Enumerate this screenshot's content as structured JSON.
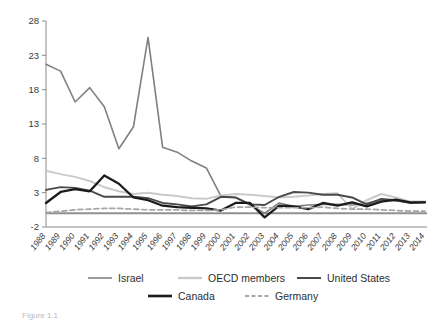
{
  "chart_data": {
    "type": "line",
    "title": "",
    "subtitle": "",
    "xlabel": "",
    "ylabel": "",
    "grid": false,
    "legend_position": "bottom",
    "xlim": [
      1988,
      2014
    ],
    "ylim": [
      -2,
      28
    ],
    "ytick_values": [
      28,
      23,
      18,
      13,
      8,
      3,
      -2
    ],
    "ytick_labels": [
      "28",
      "23",
      "18",
      "13",
      "8",
      "3",
      "-2"
    ],
    "categories": [
      "1988",
      "1989",
      "1990",
      "1991",
      "1992",
      "1993",
      "1994",
      "1995",
      "1996",
      "1997",
      "1998",
      "1999",
      "2000",
      "2001",
      "2002",
      "2003",
      "2004",
      "2005",
      "2006",
      "2007",
      "2008",
      "2009",
      "2010",
      "2011",
      "2012",
      "2013",
      "2014"
    ],
    "zero_line": 0,
    "series": [
      {
        "name": "Israel",
        "color": "#808080",
        "width": 1.6,
        "dash": "none",
        "values": [
          21.7,
          20.7,
          16.2,
          18.3,
          15.5,
          9.4,
          12.6,
          25.6,
          9.6,
          8.9,
          7.6,
          6.6,
          2.5,
          2.3,
          1.2,
          0.0,
          1.5,
          1.0,
          1.2,
          1.3,
          1.3,
          1.2,
          1.5,
          1.9,
          1.8,
          1.6,
          1.6
        ]
      },
      {
        "name": "OECD members",
        "color": "#cacaca",
        "width": 2.0,
        "dash": "none",
        "values": [
          6.2,
          5.7,
          5.3,
          4.7,
          3.8,
          3.2,
          2.8,
          3.0,
          2.7,
          2.5,
          2.2,
          2.1,
          2.6,
          2.8,
          2.7,
          2.5,
          2.3,
          2.4,
          2.6,
          2.8,
          2.9,
          0.6,
          1.9,
          2.8,
          2.3,
          1.7,
          1.7
        ]
      },
      {
        "name": "United States",
        "color": "#4a4a4a",
        "width": 1.9,
        "dash": "none",
        "values": [
          3.4,
          3.8,
          3.7,
          3.3,
          2.4,
          2.4,
          2.4,
          2.2,
          1.5,
          1.3,
          1.0,
          1.3,
          2.4,
          2.3,
          1.3,
          1.2,
          2.4,
          3.1,
          3.0,
          2.7,
          2.7,
          2.3,
          1.3,
          2.1,
          1.9,
          1.5,
          1.6
        ]
      },
      {
        "name": "Canada",
        "color": "#1b1b1b",
        "width": 2.3,
        "dash": "none",
        "values": [
          1.5,
          3.1,
          3.5,
          3.2,
          5.5,
          4.3,
          2.3,
          1.9,
          1.1,
          0.9,
          0.8,
          0.7,
          0.4,
          1.5,
          1.5,
          -0.6,
          1.1,
          1.0,
          0.6,
          1.5,
          1.1,
          1.6,
          1.0,
          1.7,
          2.0,
          1.6,
          1.6
        ]
      },
      {
        "name": "Germany",
        "color": "#a5a5a5",
        "width": 1.7,
        "dash": "5,3",
        "values": [
          0.1,
          0.3,
          0.5,
          0.6,
          0.7,
          0.7,
          0.6,
          0.5,
          0.5,
          0.5,
          0.4,
          0.4,
          0.5,
          0.9,
          0.9,
          0.8,
          0.8,
          0.8,
          0.8,
          0.9,
          0.7,
          0.6,
          0.6,
          0.5,
          0.4,
          0.3,
          0.3
        ]
      }
    ]
  },
  "legend": {
    "items": [
      {
        "label": "Israel",
        "color": "#808080",
        "width": 1.6,
        "dash": "none"
      },
      {
        "label": "OECD members",
        "color": "#cacaca",
        "width": 2.4,
        "dash": "none"
      },
      {
        "label": "United States",
        "color": "#4a4a4a",
        "width": 2.0,
        "dash": "none"
      },
      {
        "label": "Canada",
        "color": "#1b1b1b",
        "width": 2.6,
        "dash": "none"
      },
      {
        "label": "Germany",
        "color": "#a5a5a5",
        "width": 1.8,
        "dash": "4,2.5"
      }
    ]
  },
  "caption": {
    "text": "Figure 1.1"
  }
}
